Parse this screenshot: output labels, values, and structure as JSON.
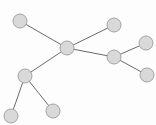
{
  "diagram": {
    "type": "tree-graph",
    "width": 156,
    "height": 125,
    "colors": {
      "background": "#fdfdfd",
      "node_fill": "#d9d9d9",
      "node_stroke": "#a3a3a3",
      "edge": "#6b6b6b"
    },
    "node_radius": 7,
    "nodes": [
      {
        "id": "n1",
        "x": 20,
        "y": 21
      },
      {
        "id": "n2",
        "x": 67,
        "y": 48
      },
      {
        "id": "n3",
        "x": 114,
        "y": 25
      },
      {
        "id": "n4",
        "x": 114,
        "y": 57
      },
      {
        "id": "n5",
        "x": 146,
        "y": 43
      },
      {
        "id": "n6",
        "x": 147,
        "y": 75
      },
      {
        "id": "n7",
        "x": 25,
        "y": 76
      },
      {
        "id": "n8",
        "x": 11,
        "y": 116
      },
      {
        "id": "n9",
        "x": 53,
        "y": 111
      }
    ],
    "edges": [
      {
        "from": "n1",
        "to": "n2"
      },
      {
        "from": "n2",
        "to": "n3"
      },
      {
        "from": "n2",
        "to": "n4"
      },
      {
        "from": "n4",
        "to": "n5"
      },
      {
        "from": "n4",
        "to": "n6"
      },
      {
        "from": "n2",
        "to": "n7"
      },
      {
        "from": "n7",
        "to": "n8"
      },
      {
        "from": "n7",
        "to": "n9"
      }
    ]
  }
}
